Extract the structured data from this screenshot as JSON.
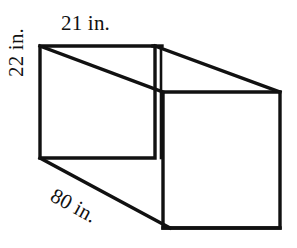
{
  "figure": {
    "name": "rectangular-prism-diagram",
    "shape": "rectangular prism",
    "projection": "oblique",
    "stroke_color": "#111111",
    "fill_color": "#ffffff",
    "background_color": "#ffffff",
    "labels": {
      "width": "21 in.",
      "height": "22 in.",
      "depth": "80 in."
    },
    "dimensions": [
      {
        "name": "width",
        "value": 21,
        "unit": "in.",
        "text": "21 in.",
        "position": "top"
      },
      {
        "name": "height",
        "value": 22,
        "unit": "in.",
        "text": "22 in.",
        "position": "left"
      },
      {
        "name": "depth",
        "value": 80,
        "unit": "in.",
        "text": "80 in.",
        "position": "bottom"
      }
    ],
    "geometry": {
      "front_face": [
        [
          40,
          46
        ],
        [
          155,
          46
        ],
        [
          155,
          158
        ],
        [
          40,
          158
        ]
      ],
      "back_face": [
        [
          163,
          92
        ],
        [
          280,
          92
        ],
        [
          280,
          228
        ],
        [
          163,
          228
        ]
      ],
      "hidden_edge": [
        [
          160,
          46
        ],
        [
          160,
          158
        ]
      ]
    }
  }
}
